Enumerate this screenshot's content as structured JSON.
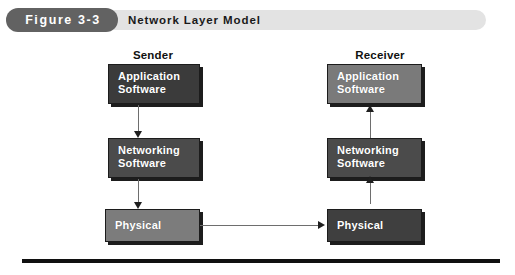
{
  "header": {
    "badge": "Figure 3-3",
    "title": "Network Layer Model",
    "badge_color": "#626262",
    "bar_color": "#e3e3e3"
  },
  "diagram": {
    "type": "layered-block-diagram",
    "columns": [
      {
        "id": "sender",
        "label": "Sender",
        "layers": [
          {
            "id": "sender-application",
            "line1": "Application",
            "line2": "Software",
            "color": "#3b3b3b"
          },
          {
            "id": "sender-networking",
            "line1": "Networking",
            "line2": "Software",
            "color": "#4b4b4b"
          },
          {
            "id": "sender-physical",
            "line1": "Physical",
            "line2": "",
            "color": "#7c7c7c"
          }
        ],
        "flow_direction": "down"
      },
      {
        "id": "receiver",
        "label": "Receiver",
        "layers": [
          {
            "id": "receiver-application",
            "line1": "Application",
            "line2": "Software",
            "color": "#7a7a7a"
          },
          {
            "id": "receiver-networking",
            "line1": "Networking",
            "line2": "Software",
            "color": "#4b4b4b"
          },
          {
            "id": "receiver-physical",
            "line1": "Physical",
            "line2": "",
            "color": "#3f3f3f"
          }
        ],
        "flow_direction": "up"
      }
    ],
    "connectors": [
      {
        "id": "sender-app-to-net",
        "from": "sender-application",
        "to": "sender-networking",
        "direction": "down"
      },
      {
        "id": "sender-net-to-phys",
        "from": "sender-networking",
        "to": "sender-physical",
        "direction": "down"
      },
      {
        "id": "physical-link",
        "from": "sender-physical",
        "to": "receiver-physical",
        "direction": "right"
      },
      {
        "id": "recv-phys-to-net",
        "from": "receiver-physical",
        "to": "receiver-networking",
        "direction": "up"
      },
      {
        "id": "recv-net-to-app",
        "from": "receiver-networking",
        "to": "receiver-application",
        "direction": "up"
      }
    ],
    "rule_color": "#101010"
  }
}
